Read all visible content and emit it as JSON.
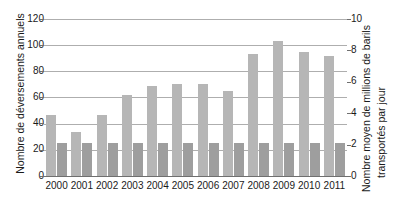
{
  "chart_data": {
    "type": "bar",
    "title": "",
    "xlabel": "",
    "grid": true,
    "legend": "none",
    "categories": [
      "2000",
      "2001",
      "2002",
      "2003",
      "2004",
      "2005",
      "2006",
      "2007",
      "2008",
      "2009",
      "2010",
      "2011"
    ],
    "series": [
      {
        "name": "Nombre de déversements annuels",
        "axis": "left",
        "color": "#b6b6b6",
        "values": [
          47,
          34,
          47,
          62,
          69,
          70,
          70,
          65,
          93,
          103,
          95,
          92
        ]
      },
      {
        "name": "Nombre moyen de millions de barils transportés par jour",
        "axis": "right",
        "color": "#9e9e9e",
        "values": [
          2.1,
          2.1,
          2.1,
          2.1,
          2.1,
          2.1,
          2.1,
          2.1,
          2.1,
          2.1,
          2.1,
          2.1
        ]
      }
    ],
    "left_axis": {
      "label": "Nombre de déversements annuels",
      "ticks": [
        "0",
        "20",
        "40",
        "60",
        "80",
        "100",
        "120"
      ],
      "ylim": [
        0,
        120
      ]
    },
    "right_axis": {
      "label_line1": "Nombre moyen de millions de barils",
      "label_line2": "transportés par jour",
      "ticks": [
        "0",
        "2",
        "4",
        "6",
        "8",
        "10"
      ],
      "ylim": [
        0,
        10
      ]
    }
  }
}
